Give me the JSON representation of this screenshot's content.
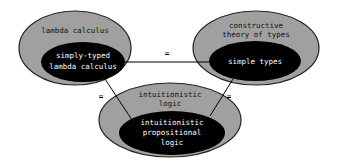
{
  "colors": {
    "outer_fill": "#a0a0a0",
    "outer_stroke": "#222222",
    "inner_fill": "#000000",
    "outer_text": "#111111",
    "inner_text": "#ffffff",
    "line": "#000000"
  },
  "nodes": {
    "lambda": {
      "outer_label": [
        "lambda calculus"
      ],
      "inner_label": [
        "simply-typed",
        "lambda calculus"
      ]
    },
    "types": {
      "outer_label": [
        "constructive",
        "theory of types"
      ],
      "inner_label": [
        "simple types"
      ]
    },
    "logic": {
      "outer_label": [
        "intuitionistic",
        "logic"
      ],
      "inner_label": [
        "intuitionistic",
        "propositional",
        "logic"
      ]
    }
  },
  "edges": [
    {
      "from": "lambda",
      "to": "types",
      "label": "="
    },
    {
      "from": "lambda",
      "to": "logic",
      "label": "="
    },
    {
      "from": "types",
      "to": "logic",
      "label": "="
    }
  ]
}
